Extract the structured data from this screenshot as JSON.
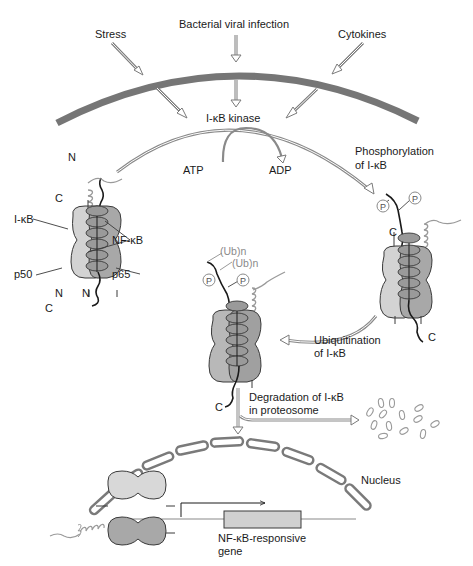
{
  "colors": {
    "membrane": "#767676",
    "light_subunit": "#d3d3d3",
    "dark_subunit": "#a8a8a8",
    "ikb_oval": "#9a9a9a",
    "outline": "#3a3a3a",
    "arrow_outline": "#7a7a7a",
    "gray_text": "#8a8a8a",
    "gene_box": "#d0d0d0"
  },
  "signals": {
    "stress": "Stress",
    "bacterial": "Bacterial viral infection",
    "cytokines": "Cytokines"
  },
  "kinase": {
    "label": "I-κB kinase",
    "atp": "ATP",
    "adp": "ADP"
  },
  "complex_inactive": {
    "n_top": "N",
    "c_left": "C",
    "ikb": "I-κB",
    "nfkb": "NF-κB",
    "p50": "p50",
    "p65": "p65",
    "n_left": "N",
    "n_right": "N",
    "c_bottom": "C"
  },
  "steps": {
    "phosphorylation_line1": "Phosphorylation",
    "phosphorylation_line2": "of I-κB",
    "ubiquitination_line1": "Ubiquitination",
    "ubiquitination_line2": "of I-κB",
    "degradation_line1": "Degradation of I-κB",
    "degradation_line2": "in proteosome"
  },
  "complex_phosphorylated": {
    "p1": "P",
    "p2": "P",
    "c_left": "C",
    "c_bottom": "C"
  },
  "complex_ubiquitinated": {
    "ub1": "(Ub)n",
    "ub2": "(Ub)n",
    "p1": "P",
    "p2": "P",
    "c_bottom": "C"
  },
  "nucleus": {
    "label": "Nucleus",
    "gene_line1": "NF-κB-responsive",
    "gene_line2": "gene"
  }
}
